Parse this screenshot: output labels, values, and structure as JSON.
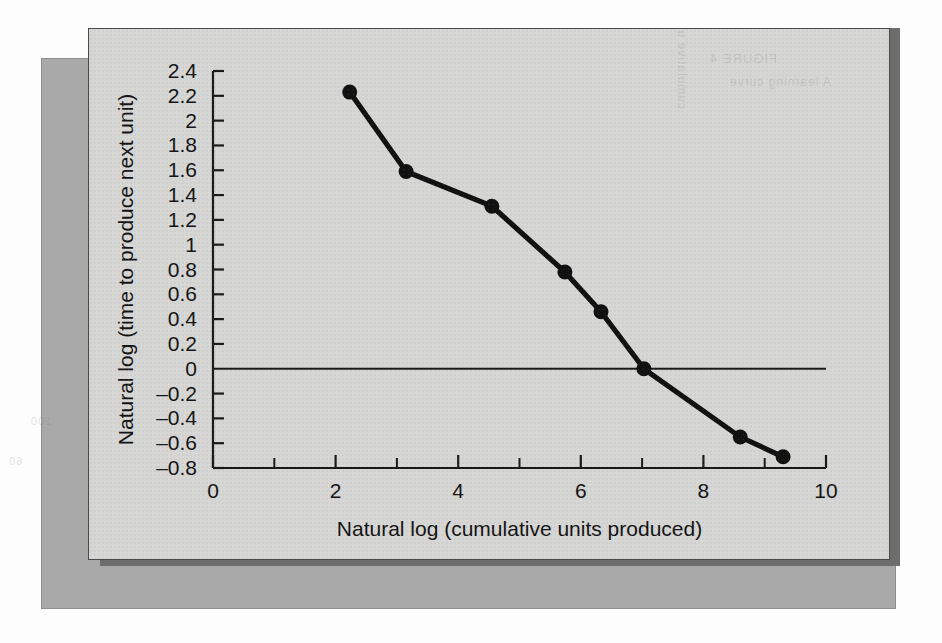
{
  "figure": {
    "card_bg": "#d6d6d4",
    "backing_bg": "#a9a9a9",
    "shadow_bg": "#6d6d6d",
    "ink": "#111111"
  },
  "ghost": {
    "line_a": "FIGURE 4",
    "line_b": "A learning curve",
    "line_c": "cumulative units",
    "line_d": "100",
    "line_e": "60"
  },
  "chart_data": {
    "type": "line",
    "title": "",
    "xlabel": "Natural log (cumulative units produced)",
    "ylabel": "Natural log (time to produce next unit)",
    "xlim": [
      0,
      10
    ],
    "ylim": [
      -0.8,
      2.4
    ],
    "x_major_ticks": [
      0,
      2,
      4,
      6,
      8,
      10
    ],
    "x_minor_ticks": [
      1,
      3,
      5,
      7,
      9
    ],
    "x_tick_labels": [
      "0",
      "2",
      "4",
      "6",
      "8",
      "10"
    ],
    "y_ticks": [
      -0.8,
      -0.6,
      -0.4,
      -0.2,
      0,
      0.2,
      0.4,
      0.6,
      0.8,
      1,
      1.2,
      1.4,
      1.6,
      1.8,
      2,
      2.2,
      2.4
    ],
    "y_tick_labels": [
      "–0.8",
      "–0.6",
      "–0.4",
      "–0.2",
      "0",
      "0.2",
      "0.4",
      "0.6",
      "0.8",
      "1",
      "1.2",
      "1.4",
      "1.6",
      "1.8",
      "2",
      "2.2",
      "2.4"
    ],
    "grid": false,
    "legend": null,
    "zero_reference_line": 0,
    "series": [
      {
        "name": "Learning curve",
        "marker": "filled-circle",
        "color": "#111111",
        "x": [
          2.23,
          3.15,
          4.55,
          5.74,
          6.33,
          7.03,
          8.6,
          9.3
        ],
        "y": [
          2.23,
          1.59,
          1.31,
          0.78,
          0.46,
          0.0,
          -0.55,
          -0.71
        ]
      }
    ]
  }
}
